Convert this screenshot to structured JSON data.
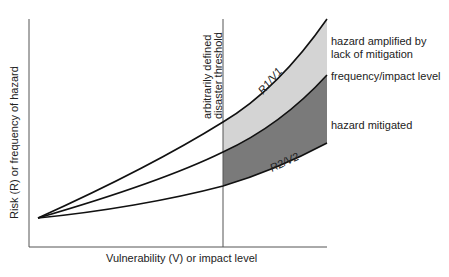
{
  "diagram": {
    "axes": {
      "y_label": "Risk (R) or frequency of hazard",
      "x_label": "Vulnerability (V) or impact level"
    },
    "threshold_label_line1": "arbitrarily defined",
    "threshold_label_line2": "disaster threshold",
    "curves": {
      "upper": "R1/V1",
      "lower": "R2/V2"
    },
    "region_labels": {
      "amplified_line1": "hazard amplified by",
      "amplified_line2": "lack of mitigation",
      "frequency": "frequency/impact level",
      "mitigated": "hazard mitigated"
    },
    "colors": {
      "light_band": "#d4d4d4",
      "dark_band": "#7a7a7a",
      "line": "#111111",
      "axis": "#555555"
    }
  }
}
